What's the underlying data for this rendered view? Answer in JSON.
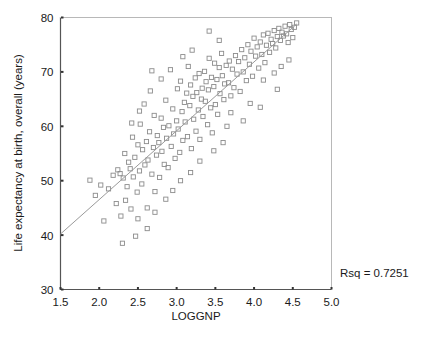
{
  "chart_data": {
    "type": "scatter",
    "title": "",
    "xlabel": "LOGGNP",
    "ylabel": "Life expectancy at birth, overall (years)",
    "xlim": [
      1.5,
      5.0
    ],
    "ylim": [
      30,
      80
    ],
    "xticks": [
      1.5,
      2.0,
      2.5,
      3.0,
      3.5,
      4.0,
      4.5,
      5.0
    ],
    "xticklabels": [
      "1.5",
      "2.0",
      "2.5",
      "3.0",
      "3.5",
      "4.0",
      "4.5",
      "5.0"
    ],
    "yticks": [
      30,
      40,
      50,
      60,
      70,
      80
    ],
    "yticklabels": [
      "30",
      "40",
      "50",
      "60",
      "70",
      "80"
    ],
    "grid": false,
    "legend": null,
    "marker": "open-square",
    "marker_color": "#8c8c8c",
    "annotations": [
      {
        "name": "rsq",
        "text": "Rsq = 0.7251",
        "x": 5.02,
        "y": 34.0
      }
    ],
    "fit_line": {
      "name": "linear-regression-line",
      "color": "#9a9a9a",
      "x": [
        1.5,
        4.55
      ],
      "y": [
        40.2,
        78.8
      ],
      "slope": 12.65,
      "intercept": 21.2
    },
    "series": [
      {
        "name": "countries",
        "points": [
          [
            1.88,
            50.1
          ],
          [
            1.95,
            47.3
          ],
          [
            2.02,
            49.2
          ],
          [
            2.06,
            42.6
          ],
          [
            2.12,
            48.5
          ],
          [
            2.18,
            51.0
          ],
          [
            2.22,
            45.8
          ],
          [
            2.24,
            52.0
          ],
          [
            2.27,
            51.3
          ],
          [
            2.28,
            43.5
          ],
          [
            2.3,
            38.5
          ],
          [
            2.31,
            50.5
          ],
          [
            2.33,
            55.0
          ],
          [
            2.34,
            46.4
          ],
          [
            2.36,
            48.9
          ],
          [
            2.38,
            53.4
          ],
          [
            2.4,
            52.2
          ],
          [
            2.41,
            44.8
          ],
          [
            2.43,
            58.0
          ],
          [
            2.44,
            50.7
          ],
          [
            2.46,
            54.3
          ],
          [
            2.47,
            39.8
          ],
          [
            2.49,
            47.9
          ],
          [
            2.5,
            56.6
          ],
          [
            2.52,
            51.8
          ],
          [
            2.53,
            60.4
          ],
          [
            2.55,
            49.4
          ],
          [
            2.56,
            55.7
          ],
          [
            2.58,
            64.1
          ],
          [
            2.59,
            52.9
          ],
          [
            2.61,
            57.2
          ],
          [
            2.62,
            45.0
          ],
          [
            2.63,
            53.8
          ],
          [
            2.65,
            59.0
          ],
          [
            2.66,
            66.5
          ],
          [
            2.68,
            51.2
          ],
          [
            2.7,
            56.1
          ],
          [
            2.71,
            62.0
          ],
          [
            2.72,
            48.0
          ],
          [
            2.74,
            54.7
          ],
          [
            2.75,
            58.3
          ],
          [
            2.77,
            57.0
          ],
          [
            2.78,
            50.6
          ],
          [
            2.8,
            61.5
          ],
          [
            2.81,
            55.4
          ],
          [
            2.83,
            59.8
          ],
          [
            2.84,
            53.0
          ],
          [
            2.86,
            64.8
          ],
          [
            2.87,
            57.8
          ],
          [
            2.89,
            52.4
          ],
          [
            2.9,
            60.1
          ],
          [
            2.92,
            70.4
          ],
          [
            2.93,
            56.3
          ],
          [
            2.95,
            63.2
          ],
          [
            2.96,
            58.6
          ],
          [
            2.98,
            54.1
          ],
          [
            3.0,
            61.0
          ],
          [
            3.01,
            66.9
          ],
          [
            3.02,
            59.5
          ],
          [
            3.04,
            55.2
          ],
          [
            3.05,
            68.3
          ],
          [
            3.07,
            62.7
          ],
          [
            3.08,
            57.4
          ],
          [
            3.1,
            64.4
          ],
          [
            3.11,
            60.8
          ],
          [
            3.13,
            66.1
          ],
          [
            3.14,
            58.1
          ],
          [
            3.15,
            71.0
          ],
          [
            3.17,
            63.8
          ],
          [
            3.18,
            67.6
          ],
          [
            3.19,
            55.9
          ],
          [
            3.21,
            65.5
          ],
          [
            3.22,
            61.3
          ],
          [
            3.24,
            68.9
          ],
          [
            3.25,
            59.1
          ],
          [
            3.26,
            66.2
          ],
          [
            3.28,
            63.0
          ],
          [
            3.29,
            69.7
          ],
          [
            3.3,
            57.6
          ],
          [
            3.32,
            65.0
          ],
          [
            3.33,
            67.0
          ],
          [
            3.34,
            61.8
          ],
          [
            3.36,
            70.1
          ],
          [
            3.37,
            64.6
          ],
          [
            3.38,
            68.2
          ],
          [
            3.4,
            60.3
          ],
          [
            3.41,
            66.7
          ],
          [
            3.42,
            72.5
          ],
          [
            3.44,
            63.4
          ],
          [
            3.45,
            69.0
          ],
          [
            3.46,
            58.8
          ],
          [
            3.48,
            67.3
          ],
          [
            3.49,
            71.6
          ],
          [
            3.5,
            64.0
          ],
          [
            3.52,
            68.6
          ],
          [
            3.53,
            62.2
          ],
          [
            3.55,
            70.8
          ],
          [
            3.56,
            66.0
          ],
          [
            3.58,
            73.4
          ],
          [
            3.59,
            69.3
          ],
          [
            3.61,
            64.9
          ],
          [
            3.62,
            67.8
          ],
          [
            3.64,
            71.2
          ],
          [
            3.65,
            60.0
          ],
          [
            3.67,
            68.0
          ],
          [
            3.68,
            72.0
          ],
          [
            3.7,
            65.6
          ],
          [
            3.72,
            70.5
          ],
          [
            3.74,
            67.1
          ],
          [
            3.76,
            73.0
          ],
          [
            3.78,
            69.6
          ],
          [
            3.8,
            71.9
          ],
          [
            3.82,
            66.4
          ],
          [
            3.84,
            74.1
          ],
          [
            3.86,
            70.0
          ],
          [
            3.88,
            72.6
          ],
          [
            3.9,
            68.4
          ],
          [
            3.92,
            75.0
          ],
          [
            3.94,
            71.4
          ],
          [
            3.96,
            73.8
          ],
          [
            3.98,
            69.2
          ],
          [
            4.0,
            76.2
          ],
          [
            4.02,
            72.9
          ],
          [
            4.04,
            74.6
          ],
          [
            4.06,
            70.7
          ],
          [
            4.08,
            75.5
          ],
          [
            4.1,
            73.2
          ],
          [
            4.12,
            76.8
          ],
          [
            4.14,
            71.7
          ],
          [
            4.16,
            74.9
          ],
          [
            4.18,
            77.1
          ],
          [
            4.2,
            73.6
          ],
          [
            4.22,
            76.0
          ],
          [
            4.24,
            75.2
          ],
          [
            4.26,
            77.6
          ],
          [
            4.28,
            74.4
          ],
          [
            4.3,
            76.5
          ],
          [
            4.32,
            78.0
          ],
          [
            4.34,
            75.8
          ],
          [
            4.36,
            77.3
          ],
          [
            4.38,
            76.6
          ],
          [
            4.4,
            78.4
          ],
          [
            4.42,
            77.0
          ],
          [
            4.44,
            75.4
          ],
          [
            4.46,
            78.7
          ],
          [
            4.48,
            77.8
          ],
          [
            4.5,
            76.3
          ],
          [
            4.52,
            78.2
          ],
          [
            4.55,
            79.0
          ],
          [
            4.12,
            68.5
          ],
          [
            4.26,
            69.8
          ],
          [
            4.35,
            71.0
          ],
          [
            3.95,
            64.2
          ],
          [
            3.7,
            62.5
          ],
          [
            3.6,
            57.0
          ],
          [
            3.48,
            55.5
          ],
          [
            3.3,
            53.6
          ],
          [
            3.18,
            51.5
          ],
          [
            3.05,
            50.0
          ],
          [
            2.95,
            48.2
          ],
          [
            2.86,
            46.6
          ],
          [
            2.72,
            44.2
          ],
          [
            2.62,
            41.2
          ],
          [
            2.5,
            43.0
          ],
          [
            3.42,
            77.5
          ],
          [
            3.55,
            75.8
          ],
          [
            2.8,
            68.7
          ],
          [
            2.68,
            70.2
          ],
          [
            3.08,
            72.8
          ],
          [
            3.2,
            74.0
          ],
          [
            2.52,
            62.8
          ],
          [
            2.42,
            60.6
          ],
          [
            4.45,
            72.2
          ],
          [
            4.3,
            66.8
          ],
          [
            4.08,
            63.5
          ],
          [
            3.86,
            61.0
          ]
        ]
      }
    ]
  },
  "axes": {
    "xlabel": "LOGGNP",
    "ylabel": "Life expectancy at birth, overall (years)"
  },
  "annotation": {
    "rsq_label": "Rsq = 0.7251"
  }
}
